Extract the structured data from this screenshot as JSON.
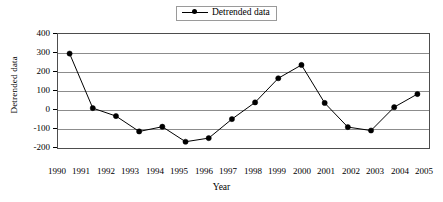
{
  "legend": {
    "entries": [
      {
        "label": "Detrended data",
        "marker": "filled-circle",
        "color": "#000000"
      }
    ],
    "position": "top-center",
    "border": true
  },
  "axes": {
    "x_title": "Year",
    "y_title": "Detrended data"
  },
  "chart_data": {
    "type": "line",
    "title": "",
    "subtitle": "",
    "xlabel": "Year",
    "ylabel": "Detrended data",
    "categories": [
      "1990",
      "1991",
      "1992",
      "1993",
      "1994",
      "1995",
      "1996",
      "1997",
      "1998",
      "1999",
      "2000",
      "2001",
      "2002",
      "2003",
      "2004",
      "2005"
    ],
    "series": [
      {
        "name": "Detrended data",
        "color": "#000000",
        "marker": "filled-circle",
        "values": [
          297,
          10,
          -32,
          -113,
          -88,
          -167,
          -148,
          -48,
          40,
          167,
          237,
          37,
          -90,
          -108,
          15,
          84
        ]
      }
    ],
    "ylim": [
      -200,
      400
    ],
    "yticks": [
      400,
      300,
      200,
      100,
      0,
      -100,
      -200
    ],
    "ytick_labels": [
      "400",
      "300",
      "200",
      "100",
      "0",
      "-100",
      "-200"
    ],
    "xtick_labels": [
      "1990",
      "1991",
      "1992",
      "1993",
      "1994",
      "1995",
      "1996",
      "1997",
      "1998",
      "1999",
      "2000",
      "2001",
      "2002",
      "2003",
      "2004",
      "2005"
    ],
    "grid": true,
    "grid_axis": "y",
    "legend_position": "top-center"
  },
  "colors": {
    "series": "#000000",
    "grid": "#8c8c8c",
    "frame": "#4d4d4d",
    "background": "#ffffff"
  }
}
